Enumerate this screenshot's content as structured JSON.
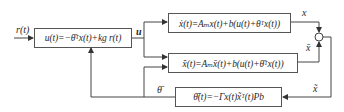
{
  "diagram": {
    "type": "block-diagram",
    "title": "",
    "blocks": {
      "controller": {
        "text": "u(t)=−θ̄ᵀx(t)+k_g r(t)",
        "display": "u(t)=−θ̄ᵀx(t)+kg r(t)"
      },
      "plant": {
        "text": "ẋ(t)=A_m x(t)+b(u(t)+θᵀx(t))",
        "display": "ẋ(t)=Aₘx(t)+b(u(t)+θᵀx(t))"
      },
      "reference_model": {
        "text": "x̄̇(t)=A_m x̄(t)+b(u(t)+θ̄ᵀx(t))",
        "display": "x̄̇(t)=Aₘx̄(t)+b(u(t)+θ̄ᵀx(t))"
      },
      "adaptive_law": {
        "text": "θ̄̇(t)=−Γx(t)x̃ᵀ(t)Pb",
        "display": "θ̄̇(t)=−Γx(t)x̃ᵀ(t)Pb"
      }
    },
    "signals": {
      "input": "r(t)",
      "control": "u",
      "plant_output": "x",
      "model_output": "x̄",
      "error": "x̃",
      "parameter_estimate": "θ̄"
    },
    "summing_junction": {
      "signs": [
        "+",
        "−"
      ]
    }
  }
}
